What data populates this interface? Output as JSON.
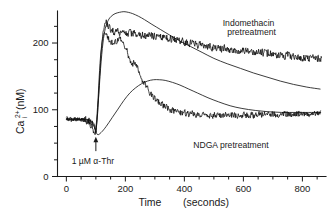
{
  "chart_data": {
    "type": "line",
    "title": "",
    "xlabel": "Time  (seconds)",
    "ylabel": "Ca2+i (nM)",
    "ylabel_parts": {
      "base": "Ca",
      "superscript": "2+",
      "subscript": "i",
      "units": "(nM)"
    },
    "xlim": [
      -30,
      880
    ],
    "ylim": [
      0,
      248
    ],
    "xticks": [
      0,
      200,
      400,
      600,
      800
    ],
    "xtick_labels": [
      "0",
      "200",
      "400",
      "600",
      "800"
    ],
    "xminor_interval": 50,
    "yticks": [
      0,
      100,
      200
    ],
    "ytick_labels": [
      "0",
      "100",
      "200"
    ],
    "yminor_interval": 25,
    "grid": false,
    "legend_position": "inline-annotations",
    "annotations": [
      {
        "name": "stimulus-arrow-label",
        "text": "1 µM α-Thr",
        "x": 100,
        "y": 30,
        "arrow_at_x": 100,
        "arrow_to_y": 58
      }
    ],
    "series": [
      {
        "name": "Indomethacin pretreatment (smooth)",
        "label": "Indomethacin\npretreatment",
        "label_line1": "Indomethacin",
        "label_line2": "pretreatment",
        "style": "smooth",
        "color": "#1a1a1a",
        "x": [
          0,
          20,
          40,
          60,
          80,
          95,
          100,
          108,
          116,
          124,
          132,
          142,
          152,
          165,
          180,
          195,
          210,
          225,
          245,
          265,
          290,
          320,
          350,
          385,
          420,
          460,
          500,
          545,
          590,
          635,
          680,
          725,
          770,
          815,
          860
        ],
        "y": [
          86,
          86,
          86,
          85,
          84,
          78,
          66,
          110,
          162,
          200,
          222,
          234,
          240,
          244,
          246,
          247,
          246,
          244,
          240,
          235,
          228,
          220,
          212,
          203,
          195,
          186,
          177,
          169,
          162,
          155,
          149,
          143,
          138,
          134,
          131
        ]
      },
      {
        "name": "Indomethacin pretreatment (trace)",
        "label": "",
        "style": "noisy",
        "color": "#0d0d0d",
        "noise_amplitude": 7,
        "x": [
          0,
          20,
          40,
          60,
          80,
          95,
          100,
          106,
          112,
          118,
          124,
          130,
          136,
          142,
          150,
          160,
          172,
          186,
          200,
          215,
          232,
          250,
          272,
          295,
          320,
          350,
          380,
          415,
          450,
          490,
          530,
          570,
          610,
          650,
          690,
          730,
          770,
          810,
          850,
          865
        ],
        "y": [
          86,
          87,
          86,
          85,
          83,
          76,
          64,
          96,
          142,
          186,
          214,
          228,
          232,
          226,
          220,
          218,
          216,
          216,
          215,
          215,
          214,
          213,
          212,
          211,
          210,
          207,
          204,
          200,
          197,
          194,
          192,
          190,
          188,
          186,
          184,
          182,
          180,
          178,
          177,
          177
        ]
      },
      {
        "name": "NDGA pretreatment (smooth)",
        "label": "NDGA pretreatment",
        "style": "smooth",
        "color": "#1a1a1a",
        "x": [
          0,
          20,
          40,
          60,
          80,
          95,
          105,
          118,
          135,
          155,
          175,
          195,
          215,
          235,
          255,
          275,
          295,
          315,
          335,
          360,
          385,
          415,
          445,
          480,
          515,
          555,
          595,
          640,
          685,
          730,
          775,
          820,
          862
        ],
        "y": [
          86,
          86,
          86,
          85,
          84,
          74,
          63,
          66,
          75,
          88,
          101,
          114,
          125,
          133,
          139,
          143,
          145,
          145,
          144,
          141,
          137,
          131,
          125,
          118,
          112,
          106,
          102,
          99,
          97,
          96,
          96,
          96,
          96
        ]
      },
      {
        "name": "NDGA pretreatment (trace)",
        "label": "",
        "style": "noisy",
        "color": "#0d0d0d",
        "noise_amplitude": 6,
        "x": [
          0,
          18,
          36,
          54,
          72,
          88,
          98,
          104,
          110,
          116,
          122,
          130,
          138,
          146,
          156,
          166,
          176,
          186,
          196,
          206,
          214,
          222,
          230,
          238,
          246,
          256,
          268,
          282,
          298,
          316,
          336,
          358,
          382,
          410,
          440,
          475,
          510,
          550,
          590,
          630,
          670,
          710,
          750,
          790,
          830,
          862
        ],
        "y": [
          86,
          85,
          86,
          85,
          84,
          74,
          62,
          92,
          138,
          182,
          206,
          216,
          210,
          204,
          200,
          202,
          206,
          204,
          198,
          188,
          176,
          165,
          172,
          168,
          158,
          146,
          136,
          126,
          118,
          110,
          104,
          99,
          96,
          94,
          93,
          92,
          92,
          92,
          92,
          92,
          93,
          93,
          94,
          94,
          95,
          96
        ]
      }
    ]
  },
  "labels": {
    "indomethacin_line1": "Indomethacin",
    "indomethacin_line2": "pretreatment",
    "ndga": "NDGA  pretreatment",
    "stimulus": "1 µM α-Thr",
    "xaxis_title_main": "Time",
    "xaxis_title_paren": "(seconds)",
    "yaxis_base": "Ca",
    "yaxis_sup": "2+",
    "yaxis_sub": "i",
    "yaxis_units": "(nM)"
  }
}
